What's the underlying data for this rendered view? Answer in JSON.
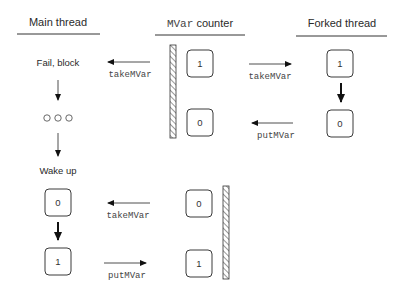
{
  "columns": {
    "main": {
      "title": "Main thread"
    },
    "mvar": {
      "title_code": "MVar",
      "title_rest": " counter"
    },
    "forked": {
      "title": "Forked thread"
    }
  },
  "phase1": {
    "main_status": "Fail, block",
    "wait_indicator": "○ ○ ○",
    "main_op": "takeMVar",
    "mvar_values": [
      "1",
      "0"
    ],
    "forked_ops": [
      "takeMVar",
      "putMVar"
    ],
    "forked_values": [
      "1",
      "0"
    ]
  },
  "phase2": {
    "main_status": "Wake up",
    "main_values": [
      "0",
      "1"
    ],
    "ops": [
      "takeMVar",
      "putMVar"
    ],
    "mvar_values": [
      "0",
      "1"
    ]
  },
  "colors": {
    "line": "#333333",
    "text": "#2a2a2a",
    "code_text": "#444444",
    "background": "#ffffff"
  }
}
